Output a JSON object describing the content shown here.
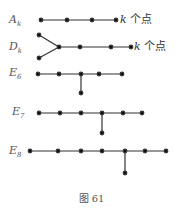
{
  "figure": {
    "caption": "图 61",
    "diagrams": [
      {
        "id": "A",
        "label": "A",
        "subscript": "k",
        "annotation_var": "k",
        "annotation_text": " 个点"
      },
      {
        "id": "D",
        "label": "D",
        "subscript": "k",
        "annotation_var": "k",
        "annotation_text": " 个点"
      },
      {
        "id": "E6",
        "label": "E",
        "subscript": "6"
      },
      {
        "id": "E7",
        "label": "E",
        "subscript": "7"
      },
      {
        "id": "E8",
        "label": "E",
        "subscript": "8"
      }
    ]
  }
}
